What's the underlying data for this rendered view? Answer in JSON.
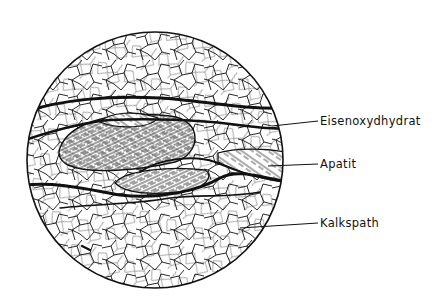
{
  "figure": {
    "labels": [
      {
        "text": "Eisenoxydhydrat",
        "x": 320,
        "y": 115
      },
      {
        "text": "Apatit",
        "x": 320,
        "y": 155
      },
      {
        "text": "Kalkspath",
        "x": 320,
        "y": 214
      }
    ],
    "leaders": [
      {
        "from": [
          272,
          126
        ],
        "to": [
          318,
          121
        ]
      },
      {
        "from": [
          268,
          166
        ],
        "to": [
          318,
          164
        ]
      },
      {
        "from": [
          240,
          228
        ],
        "to": [
          318,
          223
        ]
      }
    ]
  }
}
